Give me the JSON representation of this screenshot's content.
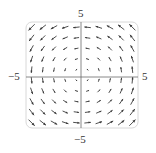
{
  "chart_data": {
    "type": "vector_field",
    "title": "",
    "field": "F(x, y) = <-y, x>",
    "rotation": "counterclockwise",
    "xlim": [
      -5,
      5
    ],
    "ylim": [
      -5,
      5
    ],
    "grid_points": {
      "x": [
        -4.5,
        -3.5,
        -2.5,
        -1.5,
        -0.5,
        0.5,
        1.5,
        2.5,
        3.5,
        4.5
      ],
      "y": [
        -4.5,
        -3.5,
        -2.5,
        -1.5,
        -0.5,
        0.5,
        1.5,
        2.5,
        3.5,
        4.5
      ]
    },
    "tick_labels": {
      "x_min": "−5",
      "x_max": "5",
      "y_min": "−5",
      "y_max": "5"
    },
    "axes_visible": true,
    "grid": false,
    "frame": "rounded-box"
  },
  "labels": {
    "top": "5",
    "bottom": "−5",
    "left": "−5",
    "right": "5"
  },
  "colors": {
    "arrow": "#3a3a3a",
    "axis": "#6a6a6a",
    "frame": "#d8d8d8"
  }
}
